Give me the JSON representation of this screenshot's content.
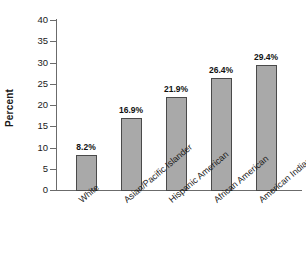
{
  "chart_data": {
    "type": "bar",
    "title": "",
    "xlabel": "",
    "ylabel": "Percent",
    "ylim": [
      0,
      40
    ],
    "grid": false,
    "legend": null,
    "categories": [
      "White",
      "Asian/Pacific Islander",
      "Hispanic American",
      "African American",
      "American Indian"
    ],
    "values": [
      8.2,
      16.9,
      21.9,
      26.4,
      29.4
    ],
    "value_labels": [
      "8.2%",
      "16.9%",
      "21.9%",
      "26.4%",
      "29.4%"
    ],
    "ytick_labels": [
      "0",
      "5",
      "10",
      "15",
      "20",
      "25",
      "30",
      "35",
      "40"
    ],
    "ytick_values": [
      0,
      5,
      10,
      15,
      20,
      25,
      30,
      35,
      40
    ],
    "bar_color": "#a9a9a9",
    "bar_border_color": "#4a4a4a",
    "axis_color": "#6b6b6b",
    "text_color": "#1a1a1a"
  }
}
